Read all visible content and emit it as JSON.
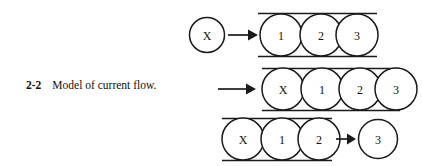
{
  "figure": {
    "number": "2-2",
    "caption": "Model of current flow.",
    "ink_color": "#1a1a1a",
    "background_color": "#ffffff"
  },
  "rows": [
    {
      "name": "row-before-entry",
      "free_circle_side": "left",
      "free_circle_label": "X",
      "arrow_direction": "right",
      "conductor_labels": [
        "1",
        "2",
        "3"
      ]
    },
    {
      "name": "row-entering",
      "free_circle_side": "none",
      "free_circle_label": "",
      "arrow_direction": "right",
      "conductor_labels": [
        "X",
        "1",
        "2",
        "3"
      ]
    },
    {
      "name": "row-exiting",
      "free_circle_side": "right",
      "free_circle_label": "3",
      "arrow_direction": "right",
      "conductor_labels": [
        "X",
        "1",
        "2"
      ]
    }
  ]
}
